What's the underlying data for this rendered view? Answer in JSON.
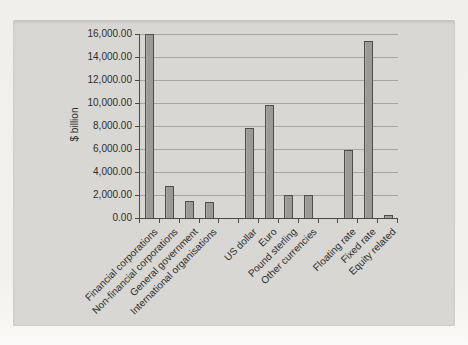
{
  "page": {
    "background_color": "#f3f1ee",
    "card_color": "#d8d7d4"
  },
  "chart_data": {
    "type": "bar",
    "title": "",
    "xlabel": "",
    "ylabel": "$ billion",
    "ylim": [
      0,
      16000
    ],
    "y_tick_step": 2000,
    "grid": "horizontal",
    "legend": "none",
    "categories": [
      "Financial corporations",
      "Non-financial corporations",
      "General government",
      "International organisations",
      "",
      "US dollar",
      "Euro",
      "Pound sterling",
      "Other currencies",
      "",
      "Floating rate",
      "Fixed rate",
      "Equity related"
    ],
    "values": [
      16000,
      2800,
      1500,
      1350,
      null,
      7800,
      9850,
      2000,
      2000,
      null,
      5900,
      15400,
      300
    ],
    "y_ticks": [
      {
        "value": 0,
        "label": "0.00"
      },
      {
        "value": 2000,
        "label": "2,000.00"
      },
      {
        "value": 4000,
        "label": "4,000.00"
      },
      {
        "value": 6000,
        "label": "6,000.00"
      },
      {
        "value": 8000,
        "label": "8,000.00"
      },
      {
        "value": 10000,
        "label": "10,000.00"
      },
      {
        "value": 12000,
        "label": "12,000.00"
      },
      {
        "value": 14000,
        "label": "14,000.00"
      },
      {
        "value": 16000,
        "label": "16,000.00"
      }
    ],
    "bar_color": "#9a9a98",
    "bar_border_color": "#4d4d4d",
    "gridline_color": "#a6a5a2",
    "axis_color": "#4a4a4a",
    "text_color": "#2e2e2e"
  }
}
